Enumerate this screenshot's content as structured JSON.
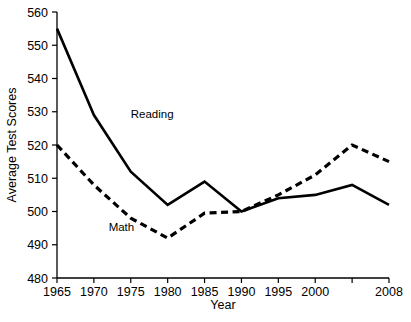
{
  "chart_data": {
    "type": "line",
    "title": "",
    "xlabel": "Year",
    "ylabel": "Average Test Scores",
    "xlim": [
      1965,
      2008
    ],
    "ylim": [
      480,
      560
    ],
    "grid": false,
    "legend_position": "inline-annotations",
    "x_ticks": [
      {
        "value": 1965,
        "label": "1965"
      },
      {
        "value": 1970,
        "label": "1970"
      },
      {
        "value": 1975,
        "label": "1975"
      },
      {
        "value": 1980,
        "label": "1980"
      },
      {
        "value": 1985,
        "label": "1985"
      },
      {
        "value": 1990,
        "label": "1990"
      },
      {
        "value": 1995,
        "label": "1995"
      },
      {
        "value": 2000,
        "label": "2000"
      },
      {
        "value": 2005,
        "label": ""
      },
      {
        "value": 2008,
        "label": "2008"
      }
    ],
    "y_ticks": [
      {
        "value": 480,
        "label": "480"
      },
      {
        "value": 490,
        "label": "490"
      },
      {
        "value": 500,
        "label": "500"
      },
      {
        "value": 510,
        "label": "510"
      },
      {
        "value": 520,
        "label": "520"
      },
      {
        "value": 530,
        "label": "530"
      },
      {
        "value": 540,
        "label": "540"
      },
      {
        "value": 550,
        "label": "550"
      },
      {
        "value": 560,
        "label": "560"
      }
    ],
    "x": [
      1965,
      1970,
      1975,
      1980,
      1985,
      1990,
      1995,
      2000,
      2005,
      2008
    ],
    "series": [
      {
        "name": "Reading",
        "style": "solid",
        "color": "#000000",
        "label_text": "Reading",
        "label_x": 1975,
        "label_y": 528,
        "values": [
          555,
          529,
          512,
          502,
          509,
          500,
          504,
          505,
          508,
          502
        ]
      },
      {
        "name": "Math",
        "style": "dashed",
        "color": "#000000",
        "label_text": "Math",
        "label_x": 1972,
        "label_y": 494,
        "values": [
          520,
          508,
          498,
          492,
          499.5,
          500,
          505,
          511,
          520,
          515
        ]
      }
    ],
    "annotations": [
      {
        "text": "Reading",
        "x": 1975,
        "y": 528
      },
      {
        "text": "Math",
        "x": 1972,
        "y": 494
      }
    ]
  },
  "axis": {
    "x_title": "Year",
    "y_title": "Average Test Scores"
  }
}
